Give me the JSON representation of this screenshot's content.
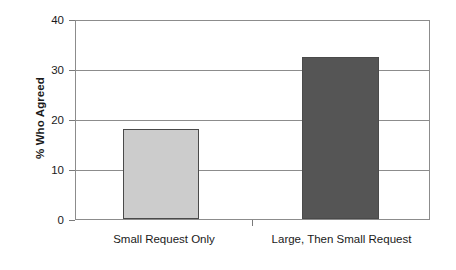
{
  "chart_data": {
    "type": "bar",
    "title": "",
    "subtitle": "",
    "xlabel": "",
    "ylabel": "% Who Agreed",
    "categories": [
      "Small Request Only",
      "Large, Then Small Request"
    ],
    "values": [
      18,
      32.5
    ],
    "series": [
      {
        "name": "% Who Agreed",
        "values": [
          18,
          32.5
        ]
      }
    ],
    "ylim": [
      0,
      40
    ],
    "yticks": [
      0,
      10,
      20,
      30,
      40
    ],
    "ytick_labels": [
      "0",
      "10",
      "20",
      "30",
      "40"
    ],
    "grid": "horizontal",
    "legend": "none",
    "bar_colors": [
      "#cccccc",
      "#555555"
    ],
    "bar_edge_color": "#4a4a4a",
    "axis_color": "#8c8c8c",
    "background": "#ffffff",
    "annotations": []
  },
  "axis": {
    "y_title": "% Who Agreed",
    "ticks": [
      {
        "value": "40",
        "y": 0
      },
      {
        "value": "30",
        "y": 50
      },
      {
        "value": "20",
        "y": 100
      },
      {
        "value": "10",
        "y": 150
      },
      {
        "value": "0",
        "y": 200
      }
    ]
  },
  "bars": [
    {
      "label": "Small Request Only",
      "value": 18,
      "color": "#cccccc"
    },
    {
      "label": "Large, Then Small Request",
      "value": 32.5,
      "color": "#555555"
    }
  ]
}
